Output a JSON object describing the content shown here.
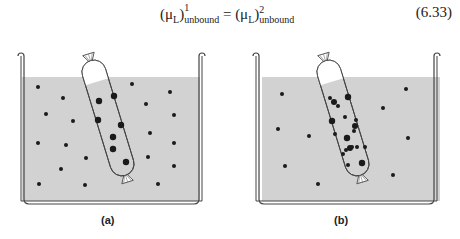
{
  "equation": {
    "lhs_symbol": "(μ",
    "lhs_sub_L": "L",
    "lhs_close": ")",
    "lhs_sup": "1",
    "lhs_sub": "unbound",
    "equals": " = ",
    "rhs_symbol": "(μ",
    "rhs_sub_L": "L",
    "rhs_close": ")",
    "rhs_sup": "2",
    "rhs_sub": "unbound",
    "number": "(6.33)"
  },
  "figures": [
    {
      "label": "(a)"
    },
    {
      "label": "(b)"
    }
  ],
  "colors": {
    "liquid": "#d2d2d2",
    "outline": "#444444",
    "dot": "#1a1a1a"
  }
}
